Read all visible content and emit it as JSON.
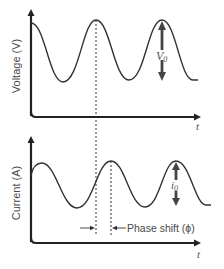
{
  "diagram": {
    "voltage_panel": {
      "y_axis_label": "Voltage (V)",
      "x_axis_label": "t",
      "amplitude_label": "V",
      "amplitude_subscript": "0"
    },
    "current_panel": {
      "y_axis_label": "Current (A)",
      "x_axis_label": "t",
      "amplitude_label": "i",
      "amplitude_subscript": "0"
    },
    "phase_shift_label": "Phase shift (ϕ)",
    "colors": {
      "curve": "#333333",
      "axis": "#222222",
      "arrow": "#444444",
      "text": "#4a4a4a"
    }
  }
}
